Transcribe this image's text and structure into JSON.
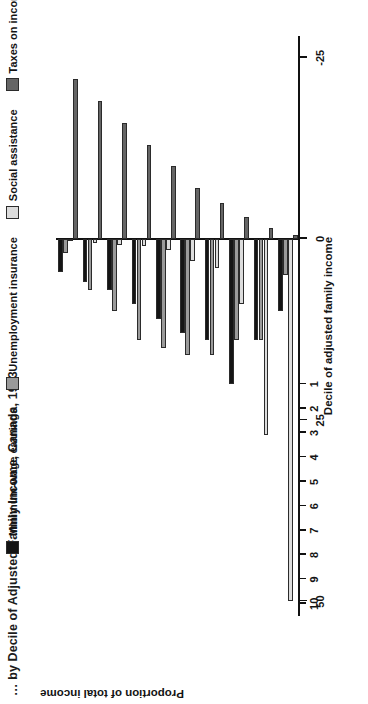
{
  "title": "… by Decile of Adjusted Family Income, Canada, 1993",
  "legend": {
    "items": [
      {
        "label": "Minimum-wage earnings",
        "color": "#141414",
        "swatch_name": "legend-swatch-minimum-wage"
      },
      {
        "label": "Unemployment insurance",
        "color": "#9a9a9a",
        "swatch_name": "legend-swatch-unemployment-insurance"
      },
      {
        "label": "Social assistance",
        "color": "#dcdcdc",
        "swatch_name": "legend-swatch-social-assistance"
      },
      {
        "label": "Taxes on income",
        "color": "#656565",
        "swatch_name": "legend-swatch-taxes-on-income"
      }
    ]
  },
  "axes": {
    "x_title": "Decile of adjusted family income",
    "y_title": "Proportion of total income",
    "y_ticks": [
      "50",
      "25",
      "0",
      "-25"
    ],
    "x_ticks": [
      "1",
      "2",
      "3",
      "4",
      "5",
      "6",
      "7",
      "8",
      "9",
      "10"
    ]
  },
  "chart_data": {
    "type": "bar",
    "title": "… by Decile of Adjusted Family Income, Canada, 1993",
    "xlabel": "Decile of adjusted family income",
    "ylabel": "Proportion of total income",
    "categories": [
      "1",
      "2",
      "3",
      "4",
      "5",
      "6",
      "7",
      "8",
      "9",
      "10"
    ],
    "ylim": [
      -28,
      52
    ],
    "yticks": [
      50,
      25,
      0,
      -25
    ],
    "grid": false,
    "legend_position": "top",
    "orientation": "vertical-grouped",
    "series": [
      {
        "name": "Minimum-wage earnings",
        "color": "#141414",
        "values": [
          10,
          14,
          20,
          14,
          13,
          11,
          9,
          7,
          6,
          4.5
        ]
      },
      {
        "name": "Unemployment insurance",
        "color": "#9a9a9a",
        "values": [
          5,
          14,
          14,
          16,
          16,
          15,
          14,
          10,
          7,
          2
        ]
      },
      {
        "name": "Social assistance",
        "color": "#dcdcdc",
        "values": [
          50,
          27,
          9,
          4,
          3,
          1.5,
          1,
          0.8,
          0.5,
          0.3
        ]
      },
      {
        "name": "Taxes on income",
        "color": "#656565",
        "values": [
          -0.5,
          -1.5,
          -3,
          -5,
          -7,
          -10,
          -13,
          -16,
          -19,
          -22
        ]
      }
    ]
  }
}
